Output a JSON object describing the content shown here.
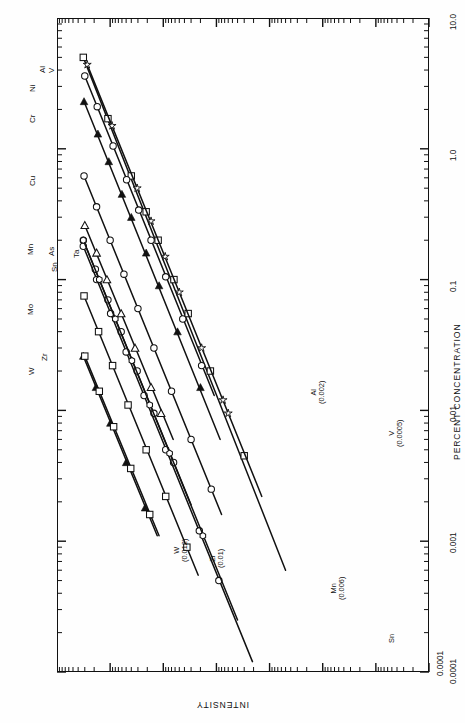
{
  "figure": {
    "background": "#ffffff",
    "ink": "#111111"
  },
  "axes": {
    "y_axis": {
      "name": "intensity-axis",
      "label": "INTENSITY",
      "orientation": "horizontal-bottom-rotated-180",
      "scale": "log",
      "ticks": [
        "0.0001"
      ],
      "decades": 4
    },
    "x_axis": {
      "name": "percent-concentration-axis",
      "label": "PERCENT CONCENTRATION",
      "orientation": "vertical-right-rotated-90",
      "scale": "log",
      "ticks": [
        "10.0",
        "1.0",
        "0.1",
        "0.01",
        "0.001",
        "0.0001"
      ]
    }
  },
  "element_labels": [
    {
      "symbol": "V",
      "left": 47,
      "top": 73
    },
    {
      "symbol": "Al",
      "left": 38,
      "top": 73
    },
    {
      "symbol": "Ni",
      "left": 28,
      "top": 92
    },
    {
      "symbol": "Cr",
      "left": 28,
      "top": 123
    },
    {
      "symbol": "Cu",
      "left": 28,
      "top": 186
    },
    {
      "symbol": "Mn",
      "left": 26,
      "top": 255
    },
    {
      "symbol": "As",
      "left": 47,
      "top": 256
    },
    {
      "symbol": "Sn",
      "left": 50,
      "top": 272
    },
    {
      "symbol": "Ta",
      "left": 72,
      "top": 258
    },
    {
      "symbol": "Mo",
      "left": 26,
      "top": 315
    },
    {
      "symbol": "Zr",
      "left": 40,
      "top": 361
    },
    {
      "symbol": "W",
      "left": 27,
      "top": 375
    }
  ],
  "detection_limits": [
    {
      "element": "Al",
      "value": "(0.002)",
      "left": 310,
      "top": 404
    },
    {
      "element": "V",
      "value": "(0.0005)",
      "left": 388,
      "top": 447
    },
    {
      "element": "W",
      "value": "(0.012)",
      "left": 173,
      "top": 562
    },
    {
      "element": "Zr",
      "value": "(0.01)",
      "left": 209,
      "top": 568
    },
    {
      "element": "Mn",
      "value": "(0.006)",
      "left": 330,
      "top": 600
    },
    {
      "element": "Sn",
      "value": "",
      "left": 388,
      "top": 643
    }
  ],
  "chart_data": {
    "type": "scatter",
    "title": "",
    "xlabel": "PERCENT CONCENTRATION",
    "ylabel": "INTENSITY",
    "xscale": "log",
    "yscale": "log",
    "xlim": [
      0.0001,
      10.0
    ],
    "ylim": [
      0.0001,
      1000
    ],
    "grid": false,
    "legend": "inline-element-labels",
    "note": "Plot is rendered rotated 90 degrees: concentration runs top-to-bottom on the right edge, intensity runs right-to-left along the bottom edge. Each element is a straight calibration line in log-log space with measured points.",
    "series": [
      {
        "name": "V",
        "marker": "open-square",
        "detection_limit": 0.0005,
        "line": {
          "x_start": 5.0,
          "y_start": 320.0,
          "x_end": 0.0006,
          "y_end": 0.05
        },
        "points": [
          {
            "x": 5.0,
            "y": 320.0
          },
          {
            "x": 1.7,
            "y": 110.0
          },
          {
            "x": 0.62,
            "y": 40.0
          },
          {
            "x": 0.33,
            "y": 21.0
          },
          {
            "x": 0.2,
            "y": 12.5
          },
          {
            "x": 0.1,
            "y": 6.3
          },
          {
            "x": 0.055,
            "y": 3.4
          },
          {
            "x": 0.02,
            "y": 1.3
          },
          {
            "x": 0.0045,
            "y": 0.3
          }
        ]
      },
      {
        "name": "Al",
        "marker": "open-star",
        "detection_limit": 0.002,
        "line": {
          "x_start": 4.4,
          "y_start": 270.0,
          "x_end": 0.0022,
          "y_end": 0.14
        },
        "points": [
          {
            "x": 4.4,
            "y": 270.0
          },
          {
            "x": 1.5,
            "y": 92.0
          },
          {
            "x": 0.5,
            "y": 31.0
          },
          {
            "x": 0.28,
            "y": 17.0
          },
          {
            "x": 0.15,
            "y": 9.2
          },
          {
            "x": 0.08,
            "y": 5.0
          },
          {
            "x": 0.03,
            "y": 1.9
          },
          {
            "x": 0.012,
            "y": 0.75
          },
          {
            "x": 0.0095,
            "y": 0.6
          }
        ]
      },
      {
        "name": "Ni",
        "marker": "open-circle",
        "line": {
          "x_start": 3.6,
          "y_start": 300.0,
          "x_end": 0.013,
          "y_end": 1.1
        },
        "points": [
          {
            "x": 3.6,
            "y": 300.0
          },
          {
            "x": 2.1,
            "y": 175.0
          },
          {
            "x": 1.05,
            "y": 88.0
          },
          {
            "x": 0.58,
            "y": 49.0
          },
          {
            "x": 0.34,
            "y": 29.0
          },
          {
            "x": 0.2,
            "y": 17.0
          },
          {
            "x": 0.105,
            "y": 9.0
          },
          {
            "x": 0.05,
            "y": 4.3
          },
          {
            "x": 0.022,
            "y": 1.9
          }
        ]
      },
      {
        "name": "Cr",
        "marker": "filled-triangle",
        "line": {
          "x_start": 2.3,
          "y_start": 310.0,
          "x_end": 0.006,
          "y_end": 0.85
        },
        "points": [
          {
            "x": 2.3,
            "y": 310.0
          },
          {
            "x": 1.3,
            "y": 170.0
          },
          {
            "x": 0.8,
            "y": 106.0
          },
          {
            "x": 0.45,
            "y": 60.0
          },
          {
            "x": 0.3,
            "y": 40.0
          },
          {
            "x": 0.16,
            "y": 21.0
          },
          {
            "x": 0.09,
            "y": 12.0
          },
          {
            "x": 0.04,
            "y": 5.4
          },
          {
            "x": 0.015,
            "y": 2.0
          }
        ]
      },
      {
        "name": "Cu",
        "marker": "open-circle",
        "line": {
          "x_start": 0.62,
          "y_start": 310.0,
          "x_end": 0.0016,
          "y_end": 0.8
        },
        "points": [
          {
            "x": 0.62,
            "y": 310.0
          },
          {
            "x": 0.36,
            "y": 180.0
          },
          {
            "x": 0.2,
            "y": 100.0
          },
          {
            "x": 0.11,
            "y": 55.0
          },
          {
            "x": 0.06,
            "y": 30.0
          },
          {
            "x": 0.03,
            "y": 15.0
          },
          {
            "x": 0.014,
            "y": 7.0
          },
          {
            "x": 0.006,
            "y": 3.0
          },
          {
            "x": 0.0025,
            "y": 1.25
          }
        ]
      },
      {
        "name": "Ta",
        "marker": "open-triangle",
        "line": {
          "x_start": 0.26,
          "y_start": 300.0,
          "x_end": 0.006,
          "y_end": 6.5
        },
        "points": [
          {
            "x": 0.26,
            "y": 300.0
          },
          {
            "x": 0.16,
            "y": 180.0
          },
          {
            "x": 0.1,
            "y": 115.0
          },
          {
            "x": 0.055,
            "y": 62.0
          },
          {
            "x": 0.03,
            "y": 34.0
          },
          {
            "x": 0.015,
            "y": 17.0
          },
          {
            "x": 0.0095,
            "y": 11.0
          }
        ]
      },
      {
        "name": "As",
        "marker": "open-circle",
        "line": {
          "x_start": 0.2,
          "y_start": 320.0,
          "x_end": 0.0019,
          "y_end": 3.0
        },
        "points": [
          {
            "x": 0.2,
            "y": 320.0
          },
          {
            "x": 0.12,
            "y": 190.0
          },
          {
            "x": 0.07,
            "y": 110.0
          },
          {
            "x": 0.04,
            "y": 62.0
          },
          {
            "x": 0.02,
            "y": 31.0
          },
          {
            "x": 0.0095,
            "y": 15.0
          },
          {
            "x": 0.004,
            "y": 6.4
          }
        ]
      },
      {
        "name": "Sn",
        "marker": "open-circle",
        "detection_limit": 0.0001,
        "line": {
          "x_start": 0.18,
          "y_start": 320.0,
          "x_end": 0.00012,
          "y_end": 0.21
        },
        "points": [
          {
            "x": 0.18,
            "y": 320.0
          },
          {
            "x": 0.1,
            "y": 180.0
          },
          {
            "x": 0.055,
            "y": 98.0
          },
          {
            "x": 0.028,
            "y": 50.0
          },
          {
            "x": 0.013,
            "y": 23.0
          },
          {
            "x": 0.005,
            "y": 9.0
          },
          {
            "x": 0.0012,
            "y": 2.1
          },
          {
            "x": 0.0005,
            "y": 0.9
          }
        ]
      },
      {
        "name": "Mo",
        "marker": "open-square",
        "line": {
          "x_start": 0.075,
          "y_start": 310.0,
          "x_end": 0.00055,
          "y_end": 2.2
        },
        "points": [
          {
            "x": 0.075,
            "y": 310.0
          },
          {
            "x": 0.04,
            "y": 165.0
          },
          {
            "x": 0.022,
            "y": 90.0
          },
          {
            "x": 0.011,
            "y": 46.0
          },
          {
            "x": 0.005,
            "y": 21.0
          },
          {
            "x": 0.0022,
            "y": 9.0
          },
          {
            "x": 0.0009,
            "y": 3.6
          }
        ]
      },
      {
        "name": "Zr",
        "marker": "filled-triangle",
        "detection_limit": 0.01,
        "line": {
          "x_start": 0.026,
          "y_start": 320.0,
          "x_end": 0.0011,
          "y_end": 13.0
        },
        "points": [
          {
            "x": 0.026,
            "y": 320.0
          },
          {
            "x": 0.015,
            "y": 185.0
          },
          {
            "x": 0.008,
            "y": 99.0
          },
          {
            "x": 0.004,
            "y": 50.0
          },
          {
            "x": 0.0018,
            "y": 22.0
          }
        ]
      },
      {
        "name": "W",
        "marker": "open-square",
        "detection_limit": 0.012,
        "line": {
          "x_start": 0.026,
          "y_start": 300.0,
          "x_end": 0.0011,
          "y_end": 12.0
        },
        "points": [
          {
            "x": 0.026,
            "y": 300.0
          },
          {
            "x": 0.014,
            "y": 160.0
          },
          {
            "x": 0.0075,
            "y": 86.0
          },
          {
            "x": 0.0036,
            "y": 41.0
          },
          {
            "x": 0.0016,
            "y": 18.0
          }
        ]
      },
      {
        "name": "Mn",
        "marker": "open-hexagon",
        "detection_limit": 0.006,
        "line": {
          "x_start": 0.2,
          "y_start": 320.0,
          "x_end": 0.00025,
          "y_end": 0.4
        },
        "points": [
          {
            "x": 0.2,
            "y": 320.0
          },
          {
            "x": 0.1,
            "y": 160.0
          },
          {
            "x": 0.05,
            "y": 80.0
          },
          {
            "x": 0.024,
            "y": 39.0
          },
          {
            "x": 0.011,
            "y": 18.0
          },
          {
            "x": 0.0047,
            "y": 7.6
          },
          {
            "x": 0.0011,
            "y": 1.8
          }
        ]
      }
    ]
  }
}
